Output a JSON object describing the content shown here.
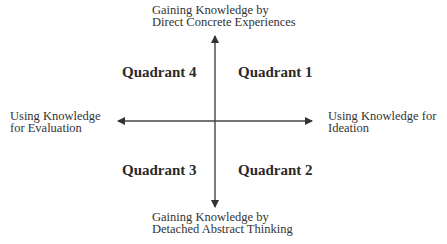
{
  "diagram": {
    "axes": {
      "top": {
        "line1": "Gaining Knowledge by",
        "line2": "Direct Concrete Experiences"
      },
      "bottom": {
        "line1": "Gaining Knowledge by",
        "line2": "Detached Abstract Thinking"
      },
      "left": {
        "line1": "Using Knowledge",
        "line2": "for Evaluation"
      },
      "right": {
        "line1": "Using Knowledge for",
        "line2": "Ideation"
      }
    },
    "quadrants": {
      "q1": "Quadrant 1",
      "q2": "Quadrant 2",
      "q3": "Quadrant 3",
      "q4": "Quadrant 4"
    },
    "colors": {
      "axis": "#3a3a3a",
      "text": "#333333",
      "background": "#ffffff"
    }
  }
}
